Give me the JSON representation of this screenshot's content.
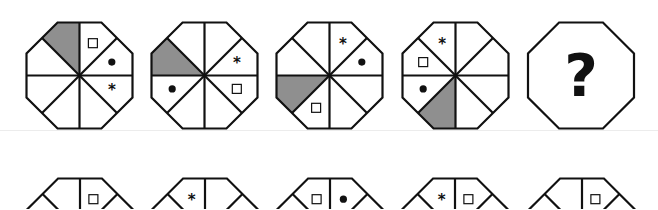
{
  "puzzle": {
    "type": "octagon-sequence",
    "colors": {
      "stroke": "#111111",
      "shade": "#8f8f8f",
      "background": "#ffffff"
    },
    "sector_order": "clockwise from 12 o'clock (sector 0 = top-right of vertical)",
    "question_row": [
      {
        "id": "q1",
        "shaded": 7,
        "symbols": [
          {
            "type": "square",
            "sector": 0
          },
          {
            "type": "dot",
            "sector": 1
          },
          {
            "type": "star",
            "sector": 2
          }
        ]
      },
      {
        "id": "q2",
        "shaded": 6,
        "symbols": [
          {
            "type": "star",
            "sector": 1
          },
          {
            "type": "square",
            "sector": 2
          },
          {
            "type": "dot",
            "sector": 5
          }
        ]
      },
      {
        "id": "q3",
        "shaded": 5,
        "symbols": [
          {
            "type": "star",
            "sector": 0
          },
          {
            "type": "dot",
            "sector": 1
          },
          {
            "type": "square",
            "sector": 4
          }
        ]
      },
      {
        "id": "q4",
        "shaded": 4,
        "symbols": [
          {
            "type": "star",
            "sector": 7
          },
          {
            "type": "square",
            "sector": 6
          },
          {
            "type": "dot",
            "sector": 5
          }
        ]
      },
      {
        "id": "q5",
        "missing": true,
        "label": "?"
      }
    ],
    "answer_row_visible_portion": [
      {
        "id": "a1",
        "symbols": [
          {
            "type": "square",
            "sector": 0
          }
        ]
      },
      {
        "id": "a2",
        "symbols": [
          {
            "type": "star",
            "sector": 7
          }
        ]
      },
      {
        "id": "a3",
        "symbols": [
          {
            "type": "square",
            "sector": 7
          },
          {
            "type": "dot",
            "sector": 0
          }
        ]
      },
      {
        "id": "a4",
        "symbols": [
          {
            "type": "star",
            "sector": 7
          },
          {
            "type": "square",
            "sector": 0
          }
        ]
      },
      {
        "id": "a5",
        "symbols": [
          {
            "type": "square",
            "sector": 0
          }
        ]
      }
    ]
  },
  "layout": {
    "top_centers": [
      [
        79.5,
        75.5
      ],
      [
        204.5,
        75.5
      ],
      [
        329.5,
        75.5
      ],
      [
        455.5,
        75.5
      ],
      [
        581,
        75.5
      ]
    ],
    "bottom_centers": [
      [
        80,
        231.5
      ],
      [
        205,
        231.5
      ],
      [
        330,
        231.5
      ],
      [
        455,
        231.5
      ],
      [
        582,
        231.5
      ]
    ],
    "apothem": 53
  }
}
